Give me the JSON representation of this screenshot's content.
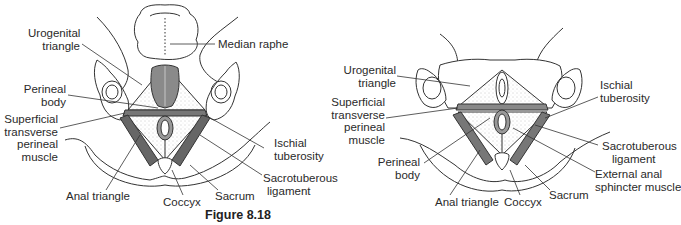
{
  "figure": {
    "caption": "Figure 8.18",
    "left_diagram": {
      "subject": "perineum-male",
      "labels": {
        "urogenital_triangle": [
          "Urogenital",
          "triangle"
        ],
        "median_raphe": "Median raphe",
        "perineal_body": [
          "Perineal",
          "body"
        ],
        "superficial_transverse_perineal_muscle": [
          "Superficial",
          "transverse",
          "perineal",
          "muscle"
        ],
        "ischial_tuberosity": [
          "Ischial",
          "tuberosity"
        ],
        "sacrotuberous_ligament": [
          "Sacrotuberous",
          "ligament"
        ],
        "anal_triangle": "Anal triangle",
        "coccyx": "Coccyx",
        "sacrum": "Sacrum"
      }
    },
    "right_diagram": {
      "subject": "perineum-female",
      "labels": {
        "urogenital_triangle": [
          "Urogenital",
          "triangle"
        ],
        "superficial_transverse_perineal_muscle": [
          "Superficial",
          "transverse",
          "perineal",
          "muscle"
        ],
        "perineal_body": [
          "Perineal",
          "body"
        ],
        "ischial_tuberosity": [
          "Ischial",
          "tuberosity"
        ],
        "sacrotuberous_ligament": [
          "Sacrotuberous",
          "ligament"
        ],
        "external_anal_sphincter_muscle": [
          "External anal",
          "sphincter muscle"
        ],
        "anal_triangle": "Anal triangle",
        "coccyx": "Coccyx",
        "sacrum": "Sacrum"
      }
    }
  }
}
